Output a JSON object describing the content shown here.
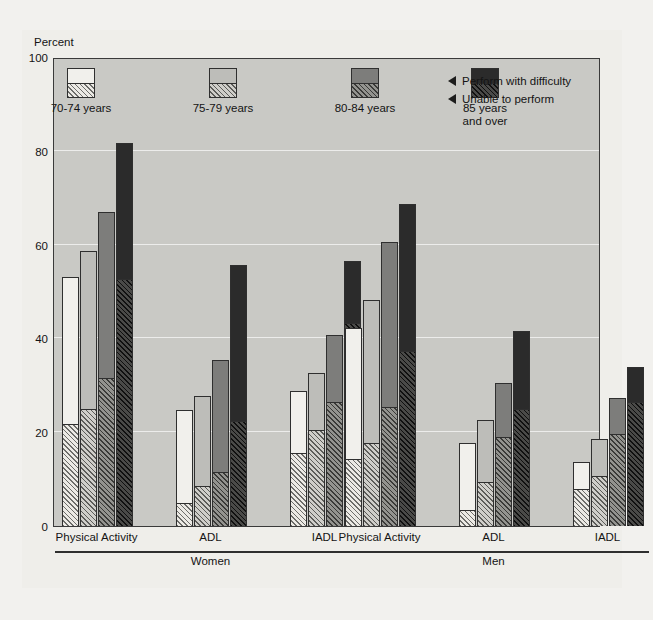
{
  "chart_data": {
    "type": "bar",
    "title": "",
    "subtitle": "",
    "xlabel": "",
    "ylabel": "Percent",
    "ylim": [
      0,
      100
    ],
    "yticks": [
      0,
      20,
      40,
      60,
      80,
      100
    ],
    "grid": true,
    "stacked": true,
    "legend_position": "top-inside",
    "legend_entries": [
      "70-74 years",
      "75-79 years",
      "80-84 years",
      "85 years\nand over"
    ],
    "segment_names": [
      "Perform with difficulty",
      "Unable to perform"
    ],
    "series_colors": [
      "#f1f0ec",
      "#bdbdb9",
      "#7d7d7b",
      "#2b2b2b"
    ],
    "sex_groups": [
      "Women",
      "Men"
    ],
    "categories": [
      "Physical Activity",
      "ADL",
      "IADL"
    ],
    "groups": [
      {
        "sex": "Women",
        "categories": [
          {
            "name": "Physical Activity",
            "bars": [
              {
                "age": "70-74 years",
                "total": 53.0,
                "unable": 21.8,
                "difficulty": 31.2
              },
              {
                "age": "75-79 years",
                "total": 58.7,
                "unable": 24.9,
                "difficulty": 33.8
              },
              {
                "age": "80-84 years",
                "total": 66.9,
                "unable": 31.5,
                "difficulty": 35.4
              },
              {
                "age": "85 years and over",
                "total": 81.6,
                "unable": 52.7,
                "difficulty": 28.9
              }
            ]
          },
          {
            "name": "ADL",
            "bars": [
              {
                "age": "70-74 years",
                "total": 24.8,
                "unable": 5.0,
                "difficulty": 19.8
              },
              {
                "age": "75-79 years",
                "total": 27.7,
                "unable": 8.5,
                "difficulty": 19.2
              },
              {
                "age": "80-84 years",
                "total": 35.4,
                "unable": 11.6,
                "difficulty": 23.8
              },
              {
                "age": "85 years and over",
                "total": 55.6,
                "unable": 22.4,
                "difficulty": 33.2
              }
            ]
          },
          {
            "name": "IADL",
            "bars": [
              {
                "age": "70-74 years",
                "total": 28.7,
                "unable": 15.6,
                "difficulty": 13.1
              },
              {
                "age": "75-79 years",
                "total": 32.6,
                "unable": 20.5,
                "difficulty": 12.1
              },
              {
                "age": "80-84 years",
                "total": 40.7,
                "unable": 26.4,
                "difficulty": 14.3
              },
              {
                "age": "85 years and over",
                "total": 56.5,
                "unable": 43.2,
                "difficulty": 13.3
              }
            ]
          }
        ]
      },
      {
        "sex": "Men",
        "categories": [
          {
            "name": "Physical Activity",
            "bars": [
              {
                "age": "70-74 years",
                "total": 42.2,
                "unable": 14.3,
                "difficulty": 27.9
              },
              {
                "age": "75-79 years",
                "total": 48.1,
                "unable": 17.7,
                "difficulty": 30.4
              },
              {
                "age": "80-84 years",
                "total": 60.5,
                "unable": 25.3,
                "difficulty": 35.2
              },
              {
                "age": "85 years and over",
                "total": 68.7,
                "unable": 37.4,
                "difficulty": 31.3
              }
            ]
          },
          {
            "name": "ADL",
            "bars": [
              {
                "age": "70-74 years",
                "total": 17.7,
                "unable": 3.4,
                "difficulty": 14.3
              },
              {
                "age": "75-79 years",
                "total": 22.5,
                "unable": 9.4,
                "difficulty": 13.1
              },
              {
                "age": "80-84 years",
                "total": 30.5,
                "unable": 19.0,
                "difficulty": 11.5
              },
              {
                "age": "85 years and over",
                "total": 41.6,
                "unable": 25.0,
                "difficulty": 16.6
              }
            ]
          },
          {
            "name": "IADL",
            "bars": [
              {
                "age": "70-74 years",
                "total": 13.6,
                "unable": 7.8,
                "difficulty": 5.8
              },
              {
                "age": "75-79 years",
                "total": 18.5,
                "unable": 10.7,
                "difficulty": 7.8
              },
              {
                "age": "80-84 years",
                "total": 27.4,
                "unable": 19.7,
                "difficulty": 7.7
              },
              {
                "age": "85 years and over",
                "total": 33.8,
                "unable": 26.5,
                "difficulty": 7.3
              }
            ]
          }
        ]
      }
    ]
  },
  "axis": {
    "y_title": "Percent",
    "y_tick_labels": [
      "100",
      "80",
      "60",
      "40",
      "20",
      "0"
    ]
  },
  "legend": {
    "items": [
      {
        "label": "70-74 years"
      },
      {
        "label": "75-79 years"
      },
      {
        "label": "80-84 years"
      },
      {
        "label": "85 years\nand over"
      }
    ],
    "callouts": [
      {
        "label": "Perform with difficulty"
      },
      {
        "label": "Unable to perform"
      }
    ]
  },
  "xaxis": {
    "sex_groups": [
      {
        "label": "Women",
        "categories": [
          "Physical Activity",
          "ADL",
          "IADL"
        ]
      },
      {
        "label": "Men",
        "categories": [
          "Physical Activity",
          "ADL",
          "IADL"
        ]
      }
    ]
  },
  "bleed_text": {
    "top": "",
    "right": ""
  }
}
